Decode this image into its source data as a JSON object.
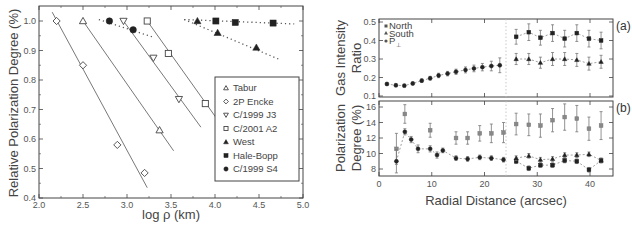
{
  "chart_data": [
    {
      "type": "scatter",
      "title": "",
      "xlabel": "log ρ (km)",
      "ylabel": "Relative Polarization Degree (%)",
      "xlim": [
        2.0,
        5.0
      ],
      "ylim": [
        0.4,
        1.05
      ],
      "x_ticks": [
        "2.0",
        "2.5",
        "3.0",
        "3.5",
        "4.0",
        "4.5",
        "5.0"
      ],
      "y_ticks": [
        "0.4",
        "0.5",
        "0.6",
        "0.7",
        "0.8",
        "0.9",
        "1.0"
      ],
      "legend_position": "lower right (inside)",
      "series": [
        {
          "name": "Tabur",
          "marker": "open-triangle-up",
          "fit": "solid",
          "points": [
            [
              2.5,
              1.0
            ],
            [
              3.37,
              0.63
            ]
          ],
          "line": [
            [
              2.5,
              1.0
            ],
            [
              3.53,
              0.56
            ]
          ]
        },
        {
          "name": "2P Encke",
          "marker": "open-diamond",
          "fit": "solid",
          "points": [
            [
              2.2,
              1.0
            ],
            [
              2.5,
              0.85
            ],
            [
              2.89,
              0.58
            ],
            [
              3.2,
              0.485
            ]
          ],
          "line": [
            [
              2.15,
              1.03
            ],
            [
              3.23,
              0.435
            ]
          ]
        },
        {
          "name": "C/1999 J3",
          "marker": "open-triangle-down",
          "fit": "solid",
          "points": [
            [
              2.96,
              1.0
            ],
            [
              3.3,
              0.875
            ],
            [
              3.59,
              0.735
            ]
          ],
          "line": [
            [
              2.96,
              1.0
            ],
            [
              3.84,
              0.64
            ]
          ]
        },
        {
          "name": "C/2001 A2",
          "marker": "open-square",
          "fit": "solid",
          "points": [
            [
              3.23,
              1.0
            ],
            [
              3.47,
              0.89
            ],
            [
              3.89,
              0.72
            ]
          ],
          "line": [
            [
              3.23,
              1.0
            ],
            [
              4.03,
              0.665
            ]
          ]
        },
        {
          "name": "West",
          "marker": "filled-triangle-up",
          "fit": "dotted",
          "points": [
            [
              3.8,
              1.0
            ],
            [
              4.03,
              0.96
            ],
            [
              4.47,
              0.91
            ]
          ],
          "line": [
            [
              3.65,
              1.005
            ],
            [
              4.73,
              0.87
            ]
          ]
        },
        {
          "name": "Hale-Bopp",
          "marker": "filled-square",
          "fit": "dotted",
          "points": [
            [
              4.01,
              1.0
            ],
            [
              4.23,
              0.995
            ],
            [
              4.66,
              0.993
            ]
          ],
          "line": [
            [
              3.65,
              1.005
            ],
            [
              4.9,
              0.99
            ]
          ]
        },
        {
          "name": "C/1999 S4",
          "marker": "filled-circle",
          "fit": "dotted",
          "points": [
            [
              2.8,
              1.0
            ],
            [
              3.07,
              0.97
            ]
          ],
          "line": [
            [
              2.68,
              1.005
            ],
            [
              3.3,
              0.945
            ]
          ]
        }
      ]
    },
    {
      "type": "scatter",
      "panel": "(a)",
      "xlabel": "Radial Distance (arcsec)",
      "ylabel": "Gas Intensity Ratio",
      "xlim": [
        0,
        44
      ],
      "ylim": [
        0.1,
        0.5
      ],
      "x_ticks": [
        "0",
        "10",
        "20",
        "30",
        "40"
      ],
      "y_ticks": [
        "0.1",
        "0.2",
        "0.3",
        "0.4",
        "0.5"
      ],
      "legend": [
        "North",
        "South",
        "P⊥"
      ],
      "legend_position": "upper left",
      "divider_x": 24,
      "series": [
        {
          "name": "Combined (inner)",
          "marker": "filled-circle",
          "x": [
            1.5,
            3.2,
            4.8,
            6.4,
            8.1,
            9.7,
            11.3,
            13.0,
            14.6,
            16.4,
            18.0,
            19.6,
            21.3,
            22.9
          ],
          "y": [
            0.165,
            0.158,
            0.156,
            0.168,
            0.183,
            0.196,
            0.211,
            0.221,
            0.231,
            0.241,
            0.249,
            0.256,
            0.262,
            0.266
          ],
          "err": [
            0.008,
            0.008,
            0.008,
            0.008,
            0.01,
            0.01,
            0.012,
            0.012,
            0.014,
            0.016,
            0.018,
            0.02,
            0.026,
            0.04
          ]
        },
        {
          "name": "North",
          "marker": "filled-square",
          "x": [
            26.0,
            28.4,
            30.6,
            32.9,
            35.2,
            37.5,
            39.8,
            42.1
          ],
          "y": [
            0.42,
            0.445,
            0.415,
            0.44,
            0.41,
            0.44,
            0.41,
            0.4
          ],
          "err": [
            0.04,
            0.045,
            0.04,
            0.045,
            0.045,
            0.045,
            0.045,
            0.045
          ]
        },
        {
          "name": "South",
          "marker": "filled-triangle-up",
          "x": [
            26.0,
            28.4,
            30.6,
            32.9,
            35.2,
            37.5,
            39.8,
            42.1
          ],
          "y": [
            0.3,
            0.3,
            0.28,
            0.3,
            0.3,
            0.295,
            0.275,
            0.285
          ],
          "err": [
            0.03,
            0.03,
            0.03,
            0.035,
            0.035,
            0.035,
            0.035,
            0.035
          ]
        }
      ]
    },
    {
      "type": "scatter",
      "panel": "(b)",
      "xlabel": "Radial Distance (arcsec)",
      "ylabel": "Polarization Degree (%)",
      "xlim": [
        0,
        44
      ],
      "ylim": [
        7,
        16.5
      ],
      "x_ticks": [
        "0",
        "10",
        "20",
        "30",
        "40"
      ],
      "y_ticks": [
        "8",
        "10",
        "12",
        "14",
        "16"
      ],
      "divider_x": 24,
      "series": [
        {
          "name": "P⊥",
          "marker": "filled-square-gray",
          "x": [
            3.3,
            4.9,
            9.7,
            14.6,
            16.8,
            19.1,
            21.3,
            23.6,
            26.0,
            28.4,
            30.6,
            32.9,
            35.2,
            37.5,
            39.8,
            42.1
          ],
          "y": [
            10.6,
            15.1,
            13.0,
            12.0,
            12.0,
            12.6,
            12.6,
            12.7,
            13.8,
            13.7,
            13.6,
            14.3,
            14.7,
            14.5,
            13.2,
            13.6
          ],
          "err": [
            2.0,
            1.2,
            0.9,
            0.8,
            0.8,
            1.0,
            1.2,
            1.3,
            1.4,
            1.4,
            1.5,
            1.5,
            1.7,
            1.7,
            1.5,
            1.8
          ]
        },
        {
          "name": "Combined (inner)",
          "marker": "filled-circle",
          "x": [
            3.3,
            4.9,
            6.1,
            7.4,
            9.7,
            11.0,
            12.1,
            14.6,
            16.8,
            19.1,
            21.3,
            23.6
          ],
          "y": [
            9.0,
            12.8,
            11.8,
            10.6,
            10.6,
            9.8,
            10.4,
            9.4,
            9.3,
            9.5,
            9.4,
            9.2
          ],
          "err": [
            1.5,
            0.4,
            0.4,
            0.5,
            0.4,
            0.4,
            0.3,
            0.3,
            0.3,
            0.3,
            0.3,
            0.3
          ]
        },
        {
          "name": "North",
          "marker": "filled-square",
          "x": [
            26.0,
            28.4,
            30.6,
            32.9,
            35.2,
            37.5,
            39.8,
            42.1
          ],
          "y": [
            9.0,
            8.1,
            8.5,
            8.5,
            9.1,
            9.0,
            7.9,
            9.1
          ],
          "err": [
            0.3,
            0.3,
            0.3,
            0.3,
            0.3,
            0.3,
            0.3,
            0.3
          ]
        },
        {
          "name": "South",
          "marker": "filled-triangle-up",
          "x": [
            26.0,
            28.4,
            30.6,
            32.9,
            35.2,
            37.5,
            39.8,
            42.1
          ],
          "y": [
            9.4,
            9.7,
            9.2,
            9.3,
            9.8,
            9.8,
            9.9,
            9.1
          ],
          "err": [
            0.3,
            0.3,
            0.3,
            0.3,
            0.3,
            0.3,
            0.3,
            0.3
          ]
        }
      ]
    }
  ],
  "left": {
    "ylabel": "Relative Polarization Degree (%)",
    "xlabel": "log ρ (km)",
    "legend": [
      "Tabur",
      "2P Encke",
      "C/1999 J3",
      "C/2001 A2",
      "West",
      "Hale-Bopp",
      "C/1999 S4"
    ]
  },
  "right": {
    "ylabel_a_line1": "Gas Intensity",
    "ylabel_a_line2": "Ratio",
    "ylabel_b_line1": "Polarization",
    "ylabel_b_line2": "Degree (%)",
    "xlabel": "Radial Distance (arcsec)",
    "panel_a": "(a)",
    "panel_b": "(b)",
    "legend_north": "North",
    "legend_south": "South",
    "legend_p": "P",
    "legend_p_sub": "⊥"
  }
}
